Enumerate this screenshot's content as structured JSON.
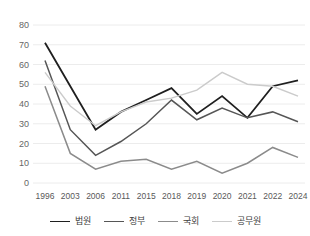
{
  "chart_data": {
    "type": "line",
    "title": "",
    "xlabel": "",
    "ylabel": "",
    "categories": [
      "1996",
      "2003",
      "2006",
      "2011",
      "2015",
      "2018",
      "2019",
      "2020",
      "2021",
      "2022",
      "2024"
    ],
    "series": [
      {
        "name": "법원",
        "color": "#1f1f1f",
        "stroke_width": 1.8,
        "values": [
          71,
          49,
          27,
          36,
          42,
          48,
          35,
          44,
          33,
          49,
          52
        ]
      },
      {
        "name": "정부",
        "color": "#565656",
        "stroke_width": 1.5,
        "values": [
          62,
          27,
          14,
          21,
          30,
          42,
          32,
          38,
          33,
          36,
          31
        ]
      },
      {
        "name": "국회",
        "color": "#8b8b8b",
        "stroke_width": 1.5,
        "values": [
          49,
          15,
          7,
          11,
          12,
          7,
          11,
          5,
          10,
          18,
          13
        ]
      },
      {
        "name": "공무원",
        "color": "#cbcbcb",
        "stroke_width": 1.4,
        "values": [
          56,
          39,
          29,
          36,
          41,
          43,
          47,
          56,
          50,
          49,
          44
        ]
      }
    ],
    "ylim": [
      0,
      80
    ],
    "yticks": [
      0,
      10,
      20,
      30,
      40,
      50,
      60,
      70,
      80
    ],
    "grid": "horizontal",
    "legend_position": "bottom"
  },
  "colors": {
    "background": "#ffffff",
    "gridline": "#ececec",
    "y_tick_label": "#666666",
    "x_tick_label": "#595959",
    "legend_label": "#404040"
  }
}
